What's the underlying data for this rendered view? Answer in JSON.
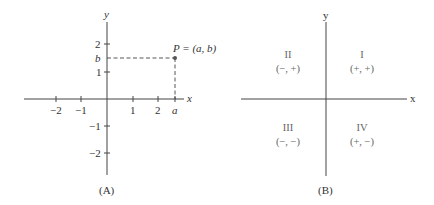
{
  "panelA": {
    "caption": "(A)",
    "x_axis_label": "x",
    "y_axis_label": "y",
    "x_ticks": [
      {
        "label": "−2",
        "value": -2
      },
      {
        "label": "−1",
        "value": -1
      },
      {
        "label": "1",
        "value": 1
      },
      {
        "label": "2",
        "value": 2
      },
      {
        "label": "a",
        "value": 2.7
      }
    ],
    "y_ticks": [
      {
        "label": "2",
        "value": 2
      },
      {
        "label": "b",
        "value": 1.5
      },
      {
        "label": "1",
        "value": 1
      },
      {
        "label": "−1",
        "value": -1
      },
      {
        "label": "−2",
        "value": -2
      }
    ],
    "point": {
      "label": "P = (a, b)",
      "x_label": "a",
      "y_label": "b"
    }
  },
  "panelB": {
    "caption": "(B)",
    "x_axis_label": "x",
    "y_axis_label": "y",
    "quadrants": [
      {
        "numeral": "I",
        "signs": "(+, +)"
      },
      {
        "numeral": "II",
        "signs": "(−, +)"
      },
      {
        "numeral": "III",
        "signs": "(−, −)"
      },
      {
        "numeral": "IV",
        "signs": "(+, −)"
      }
    ]
  },
  "colors": {
    "axis": "#444444",
    "text": "#333333",
    "quadrant_text": "#666666"
  }
}
